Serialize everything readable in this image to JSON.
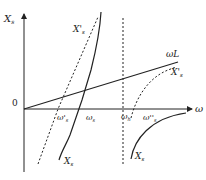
{
  "diagram": {
    "axes": {
      "y_label": "X",
      "y_label_sub": "s",
      "x_label": "ω",
      "origin_label": "0"
    },
    "curves": [
      {
        "id": "Xs_left",
        "label": "X",
        "sub": "s",
        "style": "solid"
      },
      {
        "id": "Xs_prime_left",
        "label": "X'",
        "sub": "s",
        "style": "dashed"
      },
      {
        "id": "omegaL",
        "label": "ωL",
        "style": "solid"
      },
      {
        "id": "Xs_prime_right",
        "label": "X'",
        "sub": "s",
        "style": "dashed"
      },
      {
        "id": "Xs_right",
        "label": "X",
        "sub": "s",
        "style": "solid"
      },
      {
        "id": "asymptote",
        "label": "",
        "style": "dashed"
      }
    ],
    "x_markers": [
      {
        "label": "ω'",
        "sub": "s"
      },
      {
        "label": "ω",
        "sub": "s"
      },
      {
        "label": "ω",
        "sub": "h"
      },
      {
        "label": "ω''",
        "sub": "s"
      }
    ],
    "colors": {
      "line": "#222222",
      "background": "#ffffff"
    }
  }
}
